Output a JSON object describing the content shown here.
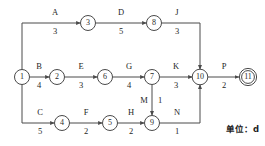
{
  "diagram": {
    "unit_note": "单位：d",
    "colors": {
      "stroke": "#4a4a4a",
      "text": "#1f1f1f",
      "background": "#ffffff"
    },
    "nodes": [
      {
        "id": "1",
        "label": "1",
        "x": 22,
        "y": 77,
        "terminal": false
      },
      {
        "id": "2",
        "label": "2",
        "x": 57,
        "y": 77,
        "terminal": false
      },
      {
        "id": "3",
        "label": "3",
        "x": 88,
        "y": 23,
        "terminal": false
      },
      {
        "id": "4",
        "label": "4",
        "x": 62,
        "y": 123,
        "terminal": false
      },
      {
        "id": "5",
        "label": "5",
        "x": 110,
        "y": 123,
        "terminal": false
      },
      {
        "id": "6",
        "label": "6",
        "x": 105,
        "y": 77,
        "terminal": false
      },
      {
        "id": "7",
        "label": "7",
        "x": 152,
        "y": 77,
        "terminal": false
      },
      {
        "id": "8",
        "label": "8",
        "x": 154,
        "y": 23,
        "terminal": false
      },
      {
        "id": "9",
        "label": "9",
        "x": 152,
        "y": 123,
        "terminal": false
      },
      {
        "id": "10",
        "label": "10",
        "x": 200,
        "y": 77,
        "terminal": false
      },
      {
        "id": "11",
        "label": "11",
        "x": 248,
        "y": 77,
        "terminal": true
      }
    ],
    "edges": [
      {
        "name": "A",
        "duration": "3",
        "from": "1",
        "to": "3",
        "name_x": 55,
        "name_y": 15,
        "dur_x": 55,
        "dur_y": 34
      },
      {
        "name": "B",
        "duration": "4",
        "from": "1",
        "to": "2",
        "name_x": 39,
        "name_y": 69,
        "dur_x": 39,
        "dur_y": 88
      },
      {
        "name": "C",
        "duration": "5",
        "from": "1",
        "to": "4",
        "name_x": 40,
        "name_y": 115,
        "dur_x": 40,
        "dur_y": 134
      },
      {
        "name": "D",
        "duration": "5",
        "from": "3",
        "to": "8",
        "name_x": 121,
        "name_y": 15,
        "dur_x": 121,
        "dur_y": 34
      },
      {
        "name": "E",
        "duration": "3",
        "from": "2",
        "to": "6",
        "name_x": 81,
        "name_y": 69,
        "dur_x": 81,
        "dur_y": 88
      },
      {
        "name": "F",
        "duration": "2",
        "from": "4",
        "to": "5",
        "name_x": 86,
        "name_y": 115,
        "dur_x": 86,
        "dur_y": 134
      },
      {
        "name": "G",
        "duration": "4",
        "from": "6",
        "to": "7",
        "name_x": 129,
        "name_y": 69,
        "dur_x": 129,
        "dur_y": 88
      },
      {
        "name": "H",
        "duration": "2",
        "from": "5",
        "to": "9",
        "name_x": 131,
        "name_y": 115,
        "dur_x": 131,
        "dur_y": 134
      },
      {
        "name": "J",
        "duration": "3",
        "from": "8",
        "to": "10",
        "name_x": 177,
        "name_y": 15,
        "dur_x": 177,
        "dur_y": 34
      },
      {
        "name": "K",
        "duration": "3",
        "from": "7",
        "to": "10",
        "name_x": 176,
        "name_y": 69,
        "dur_x": 176,
        "dur_y": 88
      },
      {
        "name": "M",
        "duration": "1",
        "from": "7",
        "to": "9",
        "name_x": 144,
        "name_y": 103,
        "dur_x": 160,
        "dur_y": 103
      },
      {
        "name": "N",
        "duration": "1",
        "from": "9",
        "to": "10",
        "name_x": 177,
        "name_y": 115,
        "dur_x": 177,
        "dur_y": 134
      },
      {
        "name": "P",
        "duration": "2",
        "from": "10",
        "to": "11",
        "name_x": 224,
        "name_y": 69,
        "dur_x": 224,
        "dur_y": 88
      }
    ]
  }
}
